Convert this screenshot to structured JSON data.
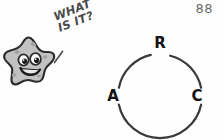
{
  "page": {
    "number": "88",
    "background_color": "#fefefe"
  },
  "character": {
    "name": "smiling-star",
    "body_color": "#bdbdbd",
    "outline_color": "#2b2b2b",
    "expression": "smiling"
  },
  "speech": {
    "text": "WHAT\nIS IT?",
    "line1": "WHAT",
    "line2": "IS IT?",
    "color": "#4a4a4a",
    "rotation_degrees": -21
  },
  "diagram": {
    "type": "circle-arc",
    "stroke_color": "#3a3a3a",
    "label_color": "#141414",
    "center": {
      "x": 57,
      "y": 78
    },
    "radius": 42,
    "labels": [
      {
        "id": "A",
        "text": "A",
        "position": "left",
        "angle_degrees": 180
      },
      {
        "id": "R",
        "text": "R",
        "position": "top",
        "angle_degrees": 90
      },
      {
        "id": "C",
        "text": "C",
        "position": "right",
        "angle_degrees": 0
      }
    ],
    "arc_segments": [
      {
        "id": "arc-A-to-R",
        "start_degrees": 168,
        "end_degrees": 104
      },
      {
        "id": "arc-R-to-C",
        "start_degrees": 76,
        "end_degrees": 12
      },
      {
        "id": "arc-C-to-A",
        "start_degrees": -12,
        "end_degrees": -168
      }
    ]
  }
}
